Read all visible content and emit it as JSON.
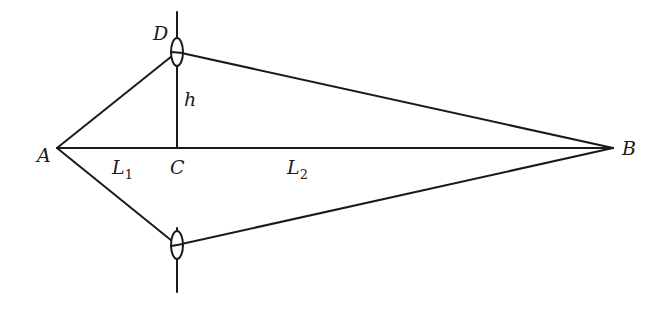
{
  "diagram": {
    "type": "geometry",
    "labels": {
      "A": "A",
      "B": "B",
      "C": "C",
      "D": "D",
      "h": "h",
      "L1_base": "L",
      "L1_sub": "1",
      "L2_base": "L",
      "L2_sub": "2"
    },
    "points": {
      "A": [
        57,
        148
      ],
      "B": [
        613,
        148
      ],
      "C": [
        177,
        148
      ],
      "D": [
        177,
        52
      ],
      "E": [
        177,
        245
      ]
    },
    "segments": [
      [
        "A",
        "B"
      ],
      [
        "A",
        "D"
      ],
      [
        "D",
        "B"
      ],
      [
        "A",
        "E"
      ],
      [
        "E",
        "B"
      ],
      [
        "C",
        "D"
      ]
    ],
    "lenses": [
      {
        "name": "upper-lens",
        "center": [
          177,
          52
        ]
      },
      {
        "name": "lower-lens",
        "center": [
          177,
          245
        ]
      }
    ]
  }
}
